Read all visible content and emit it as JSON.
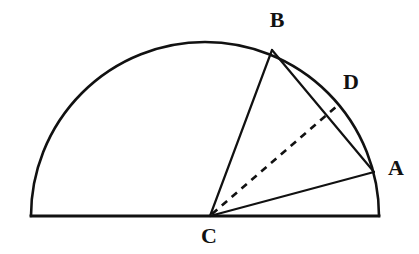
{
  "figure": {
    "kind": "geometry-diagram",
    "background_color": "#ffffff",
    "stroke_color": "#111111",
    "canvas": {
      "width": 419,
      "height": 254
    },
    "semicircle": {
      "name": "semicircle-arc",
      "center": {
        "x": 205,
        "y": 216
      },
      "radius": 174,
      "diameter_left": {
        "x": 31,
        "y": 216
      },
      "diameter_right": {
        "x": 379,
        "y": 216
      },
      "stroke_width": 2.6
    },
    "points": [
      {
        "id": "B",
        "label": "B",
        "x": 272,
        "y": 50,
        "label_x": 277,
        "label_y": 22,
        "on": "arc"
      },
      {
        "id": "D",
        "label": "D",
        "x": 336,
        "y": 107,
        "label_x": 351,
        "label_y": 84,
        "on": "arc"
      },
      {
        "id": "A",
        "label": "A",
        "x": 374,
        "y": 172,
        "label_x": 396,
        "label_y": 170,
        "on": "arc"
      },
      {
        "id": "C",
        "label": "C",
        "x": 210,
        "y": 216,
        "label_x": 209,
        "label_y": 238,
        "on": "diameter"
      }
    ],
    "segments": [
      {
        "id": "diameter",
        "name": "diameter-line",
        "from": "left-end",
        "to": "right-end",
        "style": "solid",
        "x1": 31,
        "y1": 216,
        "x2": 379,
        "y2": 216,
        "stroke_width": 2.8
      },
      {
        "id": "CB",
        "name": "segment-cb",
        "from": "C",
        "to": "B",
        "style": "solid",
        "x1": 210,
        "y1": 216,
        "x2": 272,
        "y2": 50,
        "stroke_width": 2.2
      },
      {
        "id": "BA",
        "name": "segment-ba",
        "from": "B",
        "to": "A",
        "style": "solid",
        "x1": 272,
        "y1": 50,
        "x2": 374,
        "y2": 172,
        "stroke_width": 2.2
      },
      {
        "id": "CA",
        "name": "segment-ca",
        "from": "C",
        "to": "A",
        "style": "solid",
        "x1": 210,
        "y1": 216,
        "x2": 374,
        "y2": 172,
        "stroke_width": 2.2
      },
      {
        "id": "CD",
        "name": "segment-cd",
        "from": "C",
        "to": "D",
        "style": "dashed",
        "x1": 212,
        "y1": 214,
        "x2": 337,
        "y2": 106,
        "stroke_width": 2.6,
        "dash": "7 6"
      }
    ],
    "labels": {
      "b": "B",
      "d": "D",
      "a": "A",
      "c": "C"
    }
  }
}
